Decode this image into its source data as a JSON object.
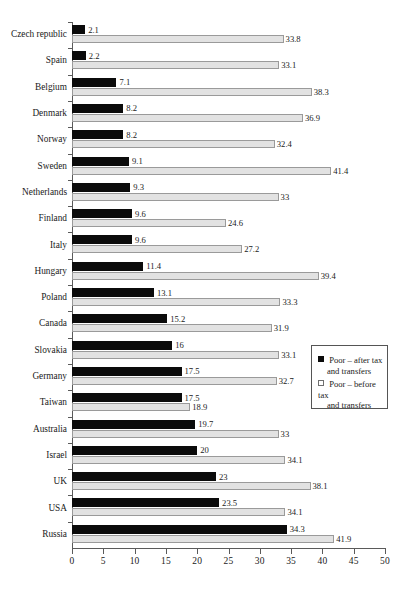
{
  "chart_data": {
    "type": "bar",
    "orientation": "horizontal",
    "title": "",
    "xlabel": "",
    "ylabel": "",
    "xlim": [
      0,
      50
    ],
    "xticks": [
      0,
      5,
      10,
      15,
      20,
      25,
      30,
      35,
      40,
      45,
      50
    ],
    "grid": false,
    "legend_position": "right-middle",
    "categories": [
      "Czech republic",
      "Spain",
      "Belgium",
      "Denmark",
      "Norway",
      "Sweden",
      "Netherlands",
      "Finland",
      "Italy",
      "Hungary",
      "Poland",
      "Canada",
      "Slovakia",
      "Germany",
      "Taiwan",
      "Australia",
      "Israel",
      "UK",
      "USA",
      "Russia"
    ],
    "series": [
      {
        "name": "Poor – after tax and transfers",
        "color": "#0b0b0b",
        "values": [
          2.1,
          2.2,
          7.1,
          8.2,
          8.2,
          9.1,
          9.3,
          9.6,
          9.6,
          11.4,
          13.1,
          15.2,
          16,
          17.5,
          17.5,
          19.7,
          20,
          23,
          23.5,
          34.3
        ],
        "labels": [
          "2.1",
          "2.2",
          "7.1",
          "8.2",
          "8.2",
          "9.1",
          "9.3",
          "9.6",
          "9.6",
          "11.4",
          "13.1",
          "15.2",
          "16",
          "17.5",
          "17.5",
          "19.7",
          "20",
          "23",
          "23.5",
          "34.3"
        ]
      },
      {
        "name": "Poor – before tax and transfers",
        "color": "#e2e2e2",
        "values": [
          33.8,
          33.1,
          38.3,
          36.9,
          32.4,
          41.4,
          33,
          24.6,
          27.2,
          39.4,
          33.3,
          31.9,
          33.1,
          32.7,
          18.9,
          33,
          34.1,
          38.1,
          34.1,
          41.9
        ],
        "labels": [
          "33.8",
          "33.1",
          "38.3",
          "36.9",
          "32.4",
          "41.4",
          "33",
          "24.6",
          "27.2",
          "39.4",
          "33.3",
          "31.9",
          "33.1",
          "32.7",
          "18.9",
          "33",
          "34.1",
          "38.1",
          "34.1",
          "41.9"
        ]
      }
    ]
  },
  "legend": {
    "items": [
      {
        "marker": "filled-square",
        "line1": "Poor – after tax",
        "line2": "and transfers"
      },
      {
        "marker": "hollow-square",
        "line1": "Poor – before tax",
        "line2": "and transfers"
      }
    ]
  }
}
